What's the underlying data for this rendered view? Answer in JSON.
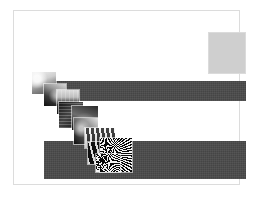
{
  "page": {
    "width": 256,
    "height": 199,
    "background_color": "#ffffff",
    "frame_color": "#dcdcdc"
  },
  "swatch": {
    "label": "",
    "fill_color": "#cfcfcf",
    "border_color": "#dbdbdb"
  },
  "bars": {
    "fill_color": "#4a4a4a",
    "top": {
      "ghost_text": "",
      "left": 30,
      "top": 70,
      "width": 202,
      "height": 20
    },
    "bottom": {
      "ghost_text": "",
      "left": 30,
      "top": 130,
      "width": 202,
      "height": 38
    }
  },
  "cascade": {
    "description": "",
    "thumbnails": [
      {
        "name": "thumbnail-1",
        "caption": "",
        "texture": "tex-a",
        "left": 30,
        "top": 70,
        "width": 26,
        "height": 24
      },
      {
        "name": "thumbnail-2",
        "caption": "",
        "texture": "tex-b",
        "left": 42,
        "top": 82,
        "width": 24,
        "height": 24
      },
      {
        "name": "thumbnail-3",
        "caption": "",
        "texture": "tex-c",
        "left": 55,
        "top": 88,
        "width": 24,
        "height": 26
      },
      {
        "name": "thumbnail-4",
        "caption": "",
        "texture": "tex-d",
        "left": 57,
        "top": 100,
        "width": 26,
        "height": 28
      },
      {
        "name": "thumbnail-5",
        "caption": "",
        "texture": "tex-e",
        "left": 70,
        "top": 104,
        "width": 28,
        "height": 26
      },
      {
        "name": "thumbnail-6",
        "caption": "",
        "texture": "tex-g",
        "left": 72,
        "top": 116,
        "width": 26,
        "height": 28
      },
      {
        "name": "thumbnail-7",
        "caption": "",
        "texture": "tex-f",
        "left": 83,
        "top": 126,
        "width": 32,
        "height": 22
      },
      {
        "name": "thumbnail-8",
        "caption": "",
        "texture": "tex-i",
        "left": 86,
        "top": 140,
        "width": 26,
        "height": 24
      },
      {
        "name": "thumbnail-9",
        "caption": "",
        "texture": "tex-h",
        "left": 98,
        "top": 136,
        "width": 34,
        "height": 36
      },
      {
        "name": "thumbnail-10",
        "caption": "",
        "texture": "tex-h",
        "left": 94,
        "top": 152,
        "width": 26,
        "height": 20
      }
    ]
  }
}
